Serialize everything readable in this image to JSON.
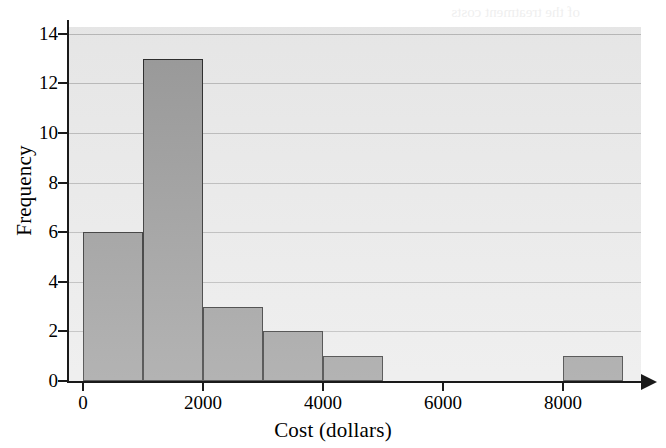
{
  "figure": {
    "ghost_text_top": "a few months this summer",
    "ghost_text_edge": "of the treatment costs"
  },
  "chart_data": {
    "type": "bar",
    "title": "",
    "xlabel": "Cost (dollars)",
    "ylabel": "Frequency",
    "xlim": [
      0,
      9600
    ],
    "ylim": [
      0,
      14.8
    ],
    "grid": true,
    "legend": "none",
    "bin_width": 1000,
    "categories": [
      "0-1000",
      "1000-2000",
      "2000-3000",
      "3000-4000",
      "4000-5000",
      "5000-6000",
      "6000-7000",
      "7000-8000",
      "8000-9000"
    ],
    "bin_starts": [
      0,
      1000,
      2000,
      3000,
      4000,
      5000,
      6000,
      7000,
      8000
    ],
    "values": [
      6,
      13,
      3,
      2,
      1,
      0,
      0,
      0,
      1
    ],
    "bars": [
      {
        "start": 0,
        "end": 1000,
        "value": 6
      },
      {
        "start": 1000,
        "end": 2000,
        "value": 13
      },
      {
        "start": 2000,
        "end": 3000,
        "value": 3
      },
      {
        "start": 3000,
        "end": 4000,
        "value": 2
      },
      {
        "start": 4000,
        "end": 5000,
        "value": 1
      },
      {
        "start": 8000,
        "end": 9000,
        "value": 1
      }
    ],
    "xticks": [
      0,
      2000,
      4000,
      6000,
      8000
    ],
    "xtick_labels": [
      "0",
      "2000",
      "4000",
      "6000",
      "8000"
    ],
    "yticks": [
      0,
      2,
      4,
      6,
      8,
      10,
      12,
      14
    ],
    "ytick_labels": [
      "0",
      "2",
      "4",
      "6",
      "8",
      "10",
      "12",
      "14"
    ],
    "colors": {
      "bar_fill": "#9a9a9a",
      "bar_edge": "#2a2a2a",
      "plot_background": "#eaeaea",
      "gridline": "#b9b9b9",
      "axis": "#1a1a1a",
      "page_background": "#ffffff"
    }
  }
}
